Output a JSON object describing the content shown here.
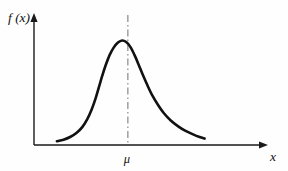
{
  "figure": {
    "background_color": "#fefefe",
    "ink_color": "#111111",
    "guide_color": "#8e8e8e"
  },
  "chart_data": {
    "type": "line",
    "title": "",
    "subtitle": "",
    "xlabel": "x",
    "ylabel": "f (x)",
    "grid": false,
    "legend": null,
    "xlim": [
      0,
      10
    ],
    "ylim": [
      0,
      1.05
    ],
    "axis_ticks": {
      "x": [],
      "y": []
    },
    "annotations": [
      {
        "name": "mean-marker",
        "label": "μ",
        "type": "vertical-dashed-line",
        "x": 4.9,
        "color": "#8e8e8e",
        "dash_style": "dash-dot",
        "label_position": "below-axis"
      }
    ],
    "series": [
      {
        "name": "density",
        "color": "#111111",
        "points": [
          [
            0.6,
            0.035
          ],
          [
            1.0,
            0.05
          ],
          [
            1.4,
            0.075
          ],
          [
            1.8,
            0.115
          ],
          [
            2.15,
            0.17
          ],
          [
            2.45,
            0.245
          ],
          [
            2.7,
            0.33
          ],
          [
            2.95,
            0.44
          ],
          [
            3.15,
            0.545
          ],
          [
            3.35,
            0.65
          ],
          [
            3.55,
            0.745
          ],
          [
            3.8,
            0.845
          ],
          [
            4.05,
            0.915
          ],
          [
            4.3,
            0.96
          ],
          [
            4.55,
            0.98
          ],
          [
            4.8,
            0.965
          ],
          [
            5.05,
            0.92
          ],
          [
            5.3,
            0.845
          ],
          [
            5.55,
            0.755
          ],
          [
            5.8,
            0.66
          ],
          [
            6.1,
            0.555
          ],
          [
            6.4,
            0.46
          ],
          [
            6.75,
            0.37
          ],
          [
            7.1,
            0.295
          ],
          [
            7.5,
            0.23
          ],
          [
            7.95,
            0.175
          ],
          [
            8.4,
            0.132
          ],
          [
            8.85,
            0.1
          ],
          [
            9.25,
            0.075
          ],
          [
            9.55,
            0.06
          ]
        ]
      }
    ]
  },
  "labels": {
    "y_axis": "f (x)",
    "x_axis": "x",
    "mean": "μ"
  }
}
